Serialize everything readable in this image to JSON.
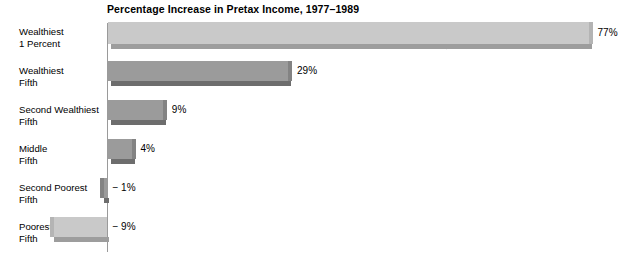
{
  "chart_data": {
    "type": "bar",
    "title": "Percentage Increase in Pretax Income, 1977–1989",
    "xlabel": "",
    "ylabel": "",
    "orientation": "horizontal",
    "grid": false,
    "legend": "none",
    "xlim": [
      -9,
      77
    ],
    "categories": [
      "Wealthiest 1 Percent",
      "Wealthiest Fifth",
      "Second Wealthiest Fifth",
      "Middle Fifth",
      "Second Poorest Fifth",
      "Poorest Fifth"
    ],
    "values": [
      77,
      29,
      9,
      4,
      -1,
      -9
    ],
    "value_labels": [
      "77%",
      "29%",
      "9%",
      "4%",
      "− 1%",
      "− 9%"
    ]
  },
  "rows": [
    {
      "label_line1": "Wealthiest",
      "label_line2": "1 Percent",
      "value": 77,
      "value_label": "77%",
      "tone": "light"
    },
    {
      "label_line1": "Wealthiest",
      "label_line2": "Fifth",
      "value": 29,
      "value_label": "29%",
      "tone": "dark"
    },
    {
      "label_line1": "Second Wealthiest",
      "label_line2": "Fifth",
      "value": 9,
      "value_label": "9%",
      "tone": "dark"
    },
    {
      "label_line1": "Middle",
      "label_line2": "Fifth",
      "value": 4,
      "value_label": "4%",
      "tone": "dark"
    },
    {
      "label_line1": "Second Poorest",
      "label_line2": "Fifth",
      "value": -1,
      "value_label": "− 1%",
      "tone": "dark"
    },
    {
      "label_line1": "Poorest",
      "label_line2": "Fifth",
      "value": -9,
      "value_label": "− 9%",
      "tone": "light"
    }
  ],
  "colors": {
    "bar_light_face": "#c9c9c9",
    "bar_light_shadow": "#9d9d9d",
    "bar_dark_face": "#9b9b9b",
    "bar_dark_shadow": "#6d6d6d",
    "axis": "#9a9a9a",
    "text": "#000000",
    "background": "#ffffff"
  }
}
